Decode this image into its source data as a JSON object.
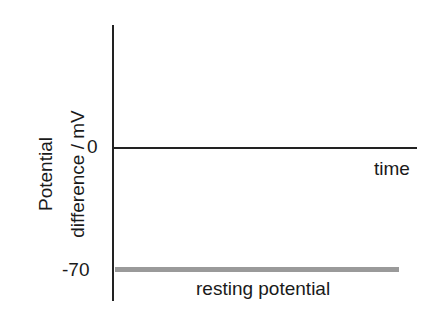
{
  "diagram": {
    "title": "",
    "y_axis": {
      "label_line1": "Potential",
      "label_line2": "difference / mV",
      "ticks": [
        {
          "value": 0,
          "label": "0"
        },
        {
          "value": -70,
          "label": "-70"
        }
      ]
    },
    "x_axis": {
      "label": "time"
    },
    "lines": [
      {
        "name": "zero-line",
        "level_mV": 0,
        "color": "#222222"
      },
      {
        "name": "resting-potential-line",
        "level_mV": -70,
        "color": "#9a9a9a",
        "label": "resting potential"
      }
    ]
  }
}
